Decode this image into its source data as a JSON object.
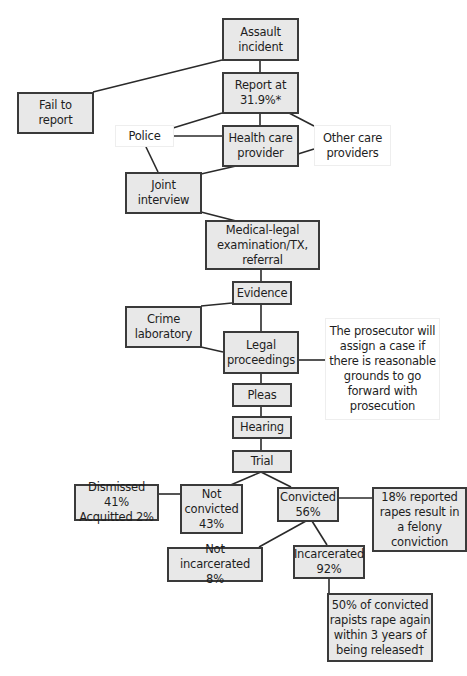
{
  "diagram": {
    "type": "flowchart",
    "colors": {
      "box_fill": "#e8e8e8",
      "box_border": "#3a3a3a",
      "line": "#2a2a2a",
      "note_fill": "#ffffff"
    },
    "nodes": [
      {
        "id": "assault",
        "label": "Assault\nincident",
        "style": "shaded",
        "x": 222,
        "y": 18,
        "w": 77,
        "h": 43
      },
      {
        "id": "report",
        "label": "Report at\n31.9%*",
        "style": "shaded",
        "x": 222,
        "y": 72,
        "w": 77,
        "h": 42
      },
      {
        "id": "fail",
        "label": "Fail to\nreport",
        "style": "shaded",
        "x": 17,
        "y": 92,
        "w": 77,
        "h": 42
      },
      {
        "id": "police",
        "label": "Police",
        "style": "plain",
        "x": 115,
        "y": 125,
        "w": 59,
        "h": 22
      },
      {
        "id": "health",
        "label": "Health care\nprovider",
        "style": "shaded",
        "x": 222,
        "y": 125,
        "w": 77,
        "h": 42
      },
      {
        "id": "other",
        "label": "Other care\nproviders",
        "style": "plain",
        "x": 314,
        "y": 125,
        "w": 77,
        "h": 41
      },
      {
        "id": "joint",
        "label": "Joint\ninterview",
        "style": "shaded",
        "x": 125,
        "y": 172,
        "w": 77,
        "h": 42
      },
      {
        "id": "medical",
        "label": "Medical-legal\nexamination/TX,\nreferral",
        "style": "shaded",
        "x": 205,
        "y": 220,
        "w": 115,
        "h": 50
      },
      {
        "id": "evidence",
        "label": "Evidence",
        "style": "shaded",
        "x": 232,
        "y": 281,
        "w": 60,
        "h": 24
      },
      {
        "id": "crimelab",
        "label": "Crime\nlaboratory",
        "style": "shaded",
        "x": 125,
        "y": 306,
        "w": 77,
        "h": 42
      },
      {
        "id": "legal",
        "label": "Legal\nproceedings",
        "style": "shaded",
        "x": 223,
        "y": 331,
        "w": 76,
        "h": 43
      },
      {
        "id": "prosecutor",
        "label": "The prosecutor will\nassign a case if\nthere is reasonable\ngrounds to go\nforward with\nprosecution",
        "style": "plain",
        "x": 325,
        "y": 318,
        "w": 115,
        "h": 102
      },
      {
        "id": "pleas",
        "label": "Pleas",
        "style": "shaded",
        "x": 232,
        "y": 383,
        "w": 60,
        "h": 24
      },
      {
        "id": "hearing",
        "label": "Hearing",
        "style": "shaded",
        "x": 232,
        "y": 416,
        "w": 60,
        "h": 23
      },
      {
        "id": "trial",
        "label": "Trial",
        "style": "shaded",
        "x": 232,
        "y": 450,
        "w": 60,
        "h": 23
      },
      {
        "id": "dismissed",
        "label": "Dismissed 41%\nAcquitted 2%",
        "style": "shaded",
        "x": 74,
        "y": 484,
        "w": 85,
        "h": 37
      },
      {
        "id": "notconvicted",
        "label": "Not\nconvicted\n43%",
        "style": "shaded",
        "x": 180,
        "y": 484,
        "w": 63,
        "h": 50
      },
      {
        "id": "convicted",
        "label": "Convicted\n56%",
        "style": "shaded",
        "x": 277,
        "y": 487,
        "w": 62,
        "h": 35
      },
      {
        "id": "felony",
        "label": "18% reported\nrapes result in\na felony\nconviction",
        "style": "shaded",
        "x": 372,
        "y": 487,
        "w": 95,
        "h": 65
      },
      {
        "id": "notincarc",
        "label": "Not incarcerated\n8%",
        "style": "shaded",
        "x": 167,
        "y": 547,
        "w": 96,
        "h": 35
      },
      {
        "id": "incarc",
        "label": "Incarcerated\n92%",
        "style": "shaded",
        "x": 293,
        "y": 545,
        "w": 72,
        "h": 34
      },
      {
        "id": "recid",
        "label": "50% of convicted\nrapists rape again\nwithin 3 years of\nbeing released†",
        "style": "shaded",
        "x": 327,
        "y": 593,
        "w": 106,
        "h": 69
      }
    ],
    "edges": [
      {
        "from": "assault",
        "to": "report",
        "pts": [
          [
            260,
            60
          ],
          [
            260,
            72
          ]
        ]
      },
      {
        "from": "assault",
        "to": "fail",
        "pts": [
          [
            222,
            60
          ],
          [
            93,
            92
          ]
        ]
      },
      {
        "from": "report",
        "to": "health",
        "pts": [
          [
            260,
            113
          ],
          [
            260,
            125
          ]
        ]
      },
      {
        "from": "report",
        "to": "police",
        "pts": [
          [
            222,
            113
          ],
          [
            173,
            128
          ]
        ]
      },
      {
        "from": "report",
        "to": "other",
        "pts": [
          [
            289,
            113
          ],
          [
            314,
            126
          ]
        ]
      },
      {
        "from": "police",
        "to": "health",
        "pts": [
          [
            173,
            136
          ],
          [
            222,
            136
          ]
        ]
      },
      {
        "from": "other",
        "to": "health",
        "pts": [
          [
            314,
            149
          ],
          [
            298,
            154
          ]
        ]
      },
      {
        "from": "police",
        "to": "joint",
        "pts": [
          [
            146,
            147
          ],
          [
            158,
            172
          ]
        ]
      },
      {
        "from": "health",
        "to": "joint",
        "pts": [
          [
            236,
            166
          ],
          [
            201,
            174
          ]
        ]
      },
      {
        "from": "joint",
        "to": "medical",
        "pts": [
          [
            201,
            212
          ],
          [
            236,
            221
          ]
        ]
      },
      {
        "from": "medical",
        "to": "evidence",
        "pts": [
          [
            261,
            269
          ],
          [
            261,
            281
          ]
        ]
      },
      {
        "from": "evidence",
        "to": "crimelab",
        "pts": [
          [
            232,
            303
          ],
          [
            201,
            306
          ]
        ]
      },
      {
        "from": "evidence",
        "to": "legal",
        "pts": [
          [
            261,
            304
          ],
          [
            261,
            331
          ]
        ]
      },
      {
        "from": "crimelab",
        "to": "legal",
        "pts": [
          [
            201,
            347
          ],
          [
            223,
            352
          ]
        ]
      },
      {
        "from": "legal",
        "to": "prosecutor",
        "pts": [
          [
            298,
            360
          ],
          [
            325,
            360
          ]
        ]
      },
      {
        "from": "legal",
        "to": "pleas",
        "pts": [
          [
            261,
            373
          ],
          [
            261,
            383
          ]
        ]
      },
      {
        "from": "pleas",
        "to": "hearing",
        "pts": [
          [
            261,
            406
          ],
          [
            261,
            416
          ]
        ]
      },
      {
        "from": "hearing",
        "to": "trial",
        "pts": [
          [
            261,
            438
          ],
          [
            261,
            450
          ]
        ]
      },
      {
        "from": "trial",
        "to": "notconvicted",
        "pts": [
          [
            261,
            472
          ],
          [
            226,
            487
          ]
        ]
      },
      {
        "from": "trial",
        "to": "convicted",
        "pts": [
          [
            261,
            472
          ],
          [
            291,
            487
          ]
        ]
      },
      {
        "from": "notconvicted",
        "to": "dismissed",
        "pts": [
          [
            180,
            494
          ],
          [
            158,
            494
          ]
        ]
      },
      {
        "from": "convicted",
        "to": "felony",
        "pts": [
          [
            338,
            498
          ],
          [
            372,
            498
          ]
        ]
      },
      {
        "from": "convicted",
        "to": "notincarc",
        "pts": [
          [
            306,
            521
          ],
          [
            259,
            547
          ]
        ]
      },
      {
        "from": "convicted",
        "to": "incarc",
        "pts": [
          [
            312,
            521
          ],
          [
            327,
            545
          ]
        ]
      },
      {
        "from": "incarc",
        "to": "recid",
        "pts": [
          [
            329,
            578
          ],
          [
            329,
            593
          ]
        ]
      }
    ]
  }
}
